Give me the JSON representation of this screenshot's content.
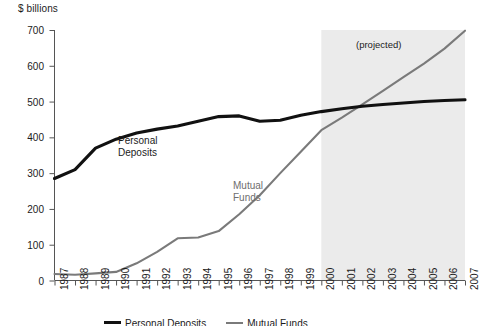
{
  "chart_data": {
    "type": "line",
    "title": "",
    "subtitle": "",
    "ylabel": "$ billions",
    "xlabel": "",
    "ylim": [
      0,
      700
    ],
    "yticks": [
      0,
      100,
      200,
      300,
      400,
      500,
      600,
      700
    ],
    "grid": false,
    "legend_position": "bottom",
    "x": [
      1987,
      1988,
      1989,
      1990,
      1991,
      1992,
      1993,
      1994,
      1995,
      1996,
      1997,
      1998,
      1999,
      2000,
      2001,
      2002,
      2003,
      2004,
      2005,
      2006,
      2007
    ],
    "categories": [
      "1987",
      "1988",
      "1989",
      "1990",
      "1991",
      "1992",
      "1993",
      "1994",
      "1995",
      "1996",
      "1997",
      "1998",
      "1999",
      "2000",
      "2001",
      "2002",
      "2003",
      "2004",
      "2005",
      "2006",
      "2007"
    ],
    "series": [
      {
        "name": "Personal Deposits",
        "color": "#111111",
        "values": [
          285,
          310,
          370,
          395,
          412,
          423,
          432,
          445,
          458,
          460,
          445,
          448,
          462,
          472,
          480,
          487,
          492,
          496,
          500,
          503,
          505
        ]
      },
      {
        "name": "Mutual Funds",
        "color": "#7a7a7a",
        "values": [
          18,
          16,
          20,
          24,
          48,
          80,
          118,
          120,
          138,
          185,
          238,
          300,
          360,
          420,
          455,
          492,
          530,
          568,
          606,
          648,
          698
        ]
      }
    ],
    "annotations": [
      {
        "text": "(projected)",
        "x": 2002.5,
        "y": 640
      }
    ],
    "shaded_regions": [
      {
        "label": "(projected)",
        "from": 2000,
        "to": 2007,
        "color": "#ebebeb"
      }
    ]
  },
  "axis": {
    "y_title": "$ billions",
    "y_tick_labels": [
      "700",
      "600",
      "500",
      "400",
      "300",
      "200",
      "100",
      "0"
    ],
    "x_tick_labels": [
      "1987",
      "1988",
      "1989",
      "1990",
      "1991",
      "1992",
      "1993",
      "1994",
      "1995",
      "1996",
      "1997",
      "1998",
      "1999",
      "2000",
      "2001",
      "2002",
      "2003",
      "2004",
      "2005",
      "2006",
      "2007"
    ]
  },
  "labels": {
    "personal_deposits_line1": "Personal",
    "personal_deposits_line2": "Deposits",
    "mutual_funds_line1": "Mutual",
    "mutual_funds_line2": "Funds",
    "projected": "(projected)"
  },
  "legend": {
    "personal_deposits": "Personal Deposits",
    "mutual_funds": "Mutual Funds"
  },
  "colors": {
    "personal_deposits": "#111111",
    "mutual_funds": "#7a7a7a",
    "projected_band": "#ebebeb",
    "axis": "#555555",
    "text": "#1b1b1b"
  }
}
